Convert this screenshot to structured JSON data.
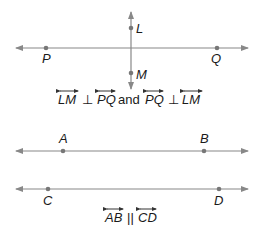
{
  "diagram1": {
    "points": {
      "L": "L",
      "M": "M",
      "P": "P",
      "Q": "Q"
    },
    "caption": {
      "part1": "LM",
      "perp1": "⊥",
      "part2": "PQ",
      "and": "and",
      "part3": "PQ",
      "perp2": "⊥",
      "part4": "LM"
    }
  },
  "diagram2": {
    "points": {
      "A": "A",
      "B": "B",
      "C": "C",
      "D": "D"
    },
    "caption": {
      "part1": "AB",
      "parallel": "||",
      "part2": "CD"
    }
  },
  "colors": {
    "line": "#888888",
    "point": "#777777",
    "text": "#1a1a1a"
  }
}
